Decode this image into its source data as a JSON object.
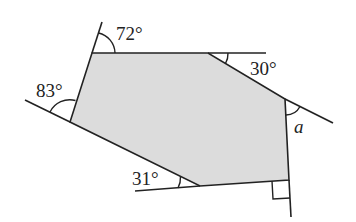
{
  "diagram": {
    "type": "hexagon-exterior-angles",
    "fill_color": "#dcdcdc",
    "stroke_color": "#222222",
    "background": "#ffffff",
    "labels": {
      "top_left": "72°",
      "top_right": "30°",
      "right": "a",
      "bottom": "31°",
      "left": "83°"
    },
    "right_angle_marker": "bottom-right"
  }
}
